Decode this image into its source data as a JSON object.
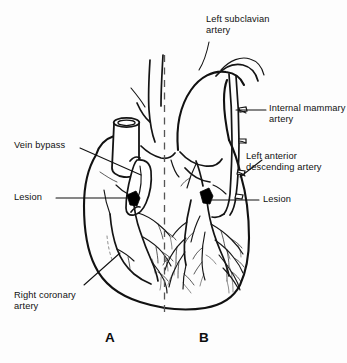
{
  "figure": {
    "background_color": "#fdfdfd",
    "ink_color": "#111111",
    "lesion_color": "#000000",
    "midline_color": "#555555"
  },
  "labels": {
    "left_subclavian": {
      "text": "Left subclavian\nartery",
      "side": "top",
      "leader": "curved-down-left"
    },
    "internal_mammary": {
      "text": "Internal mammary\nartery",
      "side": "right",
      "leader": "horizontal"
    },
    "left_anterior_descending": {
      "text": "Left anterior\ndescending artery",
      "side": "right",
      "leader": "diagonal-down-left"
    },
    "lesion_right": {
      "text": "Lesion",
      "side": "right",
      "leader": "horizontal"
    },
    "vein_bypass": {
      "text": "Vein bypass",
      "side": "left",
      "leader": "diagonal-down-right"
    },
    "lesion_left": {
      "text": "Lesion",
      "side": "left",
      "leader": "horizontal"
    },
    "right_coronary": {
      "text": "Right coronary\nartery",
      "side": "left",
      "leader": "diagonal-up-right"
    }
  },
  "panels": [
    {
      "id": "A",
      "caption": "A",
      "graft": "Vein bypass",
      "description": "Saphenous vein graft from ascending aorta"
    },
    {
      "id": "B",
      "caption": "B",
      "graft": "Internal mammary artery",
      "description": "Left internal mammary artery graft from subclavian artery"
    }
  ]
}
